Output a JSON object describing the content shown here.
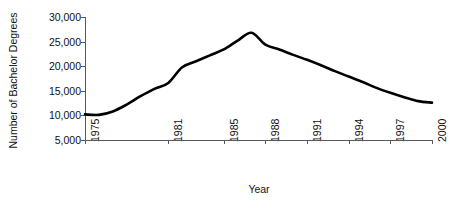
{
  "chart_data": {
    "type": "line",
    "title": "",
    "xlabel": "Year",
    "ylabel": "Number of Bachelor Degrees",
    "xlim": [
      1975,
      2000
    ],
    "ylim": [
      5000,
      30000
    ],
    "grid": false,
    "legend": null,
    "xticks": [
      "1975",
      "1981",
      "1985",
      "1988",
      "1991",
      "1994",
      "1997",
      "2000"
    ],
    "xtick_values": [
      1975,
      1981,
      1985,
      1988,
      1991,
      1994,
      1997,
      2000
    ],
    "yticks": [
      "5,000",
      "10,000",
      "15,000",
      "20,000",
      "25,000",
      "30,000"
    ],
    "ytick_values": [
      5000,
      10000,
      15000,
      20000,
      25000,
      30000
    ],
    "series": [
      {
        "name": "Number of Bachelor Degrees",
        "color": "#000000",
        "line_width": 2.6,
        "x": [
          1975,
          1976,
          1977,
          1978,
          1979,
          1980,
          1981,
          1982,
          1983,
          1984,
          1985,
          1986,
          1987,
          1988,
          1989,
          1990,
          1991,
          1992,
          1993,
          1994,
          1995,
          1996,
          1997,
          1998,
          1999,
          2000
        ],
        "values": [
          10200,
          10100,
          10800,
          12200,
          13900,
          15400,
          16600,
          19800,
          21000,
          22200,
          23400,
          25200,
          26800,
          24400,
          23400,
          22300,
          21300,
          20200,
          19000,
          17900,
          16800,
          15600,
          14600,
          13700,
          12900,
          12600
        ]
      }
    ]
  },
  "axis": {
    "axis_color": "#58595b",
    "tick_color": "#58595b",
    "text_color": "#111111",
    "background": "#ffffff"
  }
}
